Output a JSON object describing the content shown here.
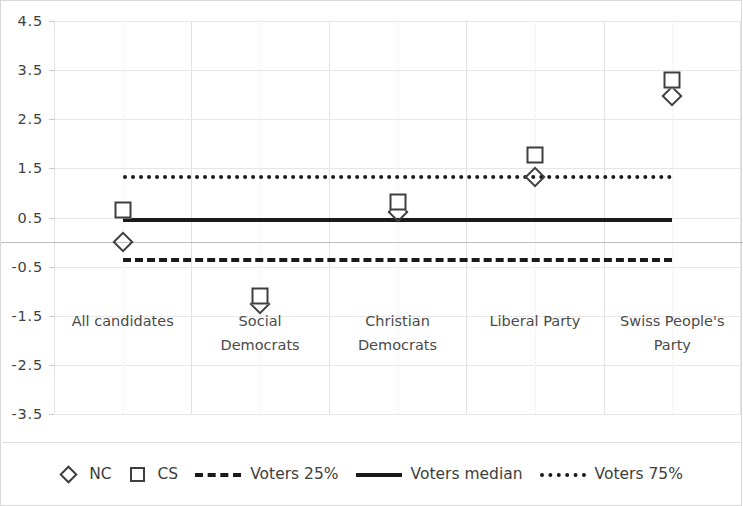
{
  "chart_data": {
    "type": "scatter",
    "title": "",
    "xlabel": "",
    "ylabel": "",
    "ylim": [
      -3.5,
      4.5
    ],
    "ytick_step": 1,
    "ytick_labels": [
      "4.5",
      "3.5",
      "2.5",
      "1.5",
      "0.5",
      "-0.5",
      "-1.5",
      "-2.5",
      "-3.5"
    ],
    "ytick_values": [
      4.5,
      3.5,
      2.5,
      1.5,
      0.5,
      -0.5,
      -1.5,
      -2.5,
      -3.5
    ],
    "grid": true,
    "legend_position": "bottom",
    "categories": [
      "All candidates",
      "Social Democrats",
      "Christian Democrats",
      "Liberal Party",
      "Swiss People's Party"
    ],
    "category_lines": [
      [
        "All candidates"
      ],
      [
        "Social",
        "Democrats"
      ],
      [
        "Christian",
        "Democrats"
      ],
      [
        "Liberal Party"
      ],
      [
        "Swiss People's",
        "Party"
      ]
    ],
    "series": [
      {
        "name": "NC",
        "marker": "diamond",
        "values": [
          0.0,
          -1.27,
          0.62,
          1.32,
          2.98
        ]
      },
      {
        "name": "CS",
        "marker": "square",
        "values": [
          0.65,
          -1.1,
          0.82,
          1.78,
          3.3
        ]
      }
    ],
    "reference_lines": [
      {
        "name": "Voters 25%",
        "style": "dashed",
        "value": -0.33
      },
      {
        "name": "Voters median",
        "style": "solid",
        "value": 0.48
      },
      {
        "name": "Voters 75%",
        "style": "dotted",
        "value": 1.37
      }
    ],
    "legend": [
      {
        "label": "NC",
        "symbol": "diamond"
      },
      {
        "label": "CS",
        "symbol": "square"
      },
      {
        "label": "Voters 25%",
        "symbol": "dashed-line"
      },
      {
        "label": "Voters median",
        "symbol": "solid-line"
      },
      {
        "label": "Voters 75%",
        "symbol": "dotted-line"
      }
    ],
    "colors": {
      "marker_stroke": "#3f3f3f",
      "reference_line": "#1a1a1a",
      "grid": "#e2e2e2",
      "text": "#404040",
      "background": "#ffffff"
    }
  }
}
